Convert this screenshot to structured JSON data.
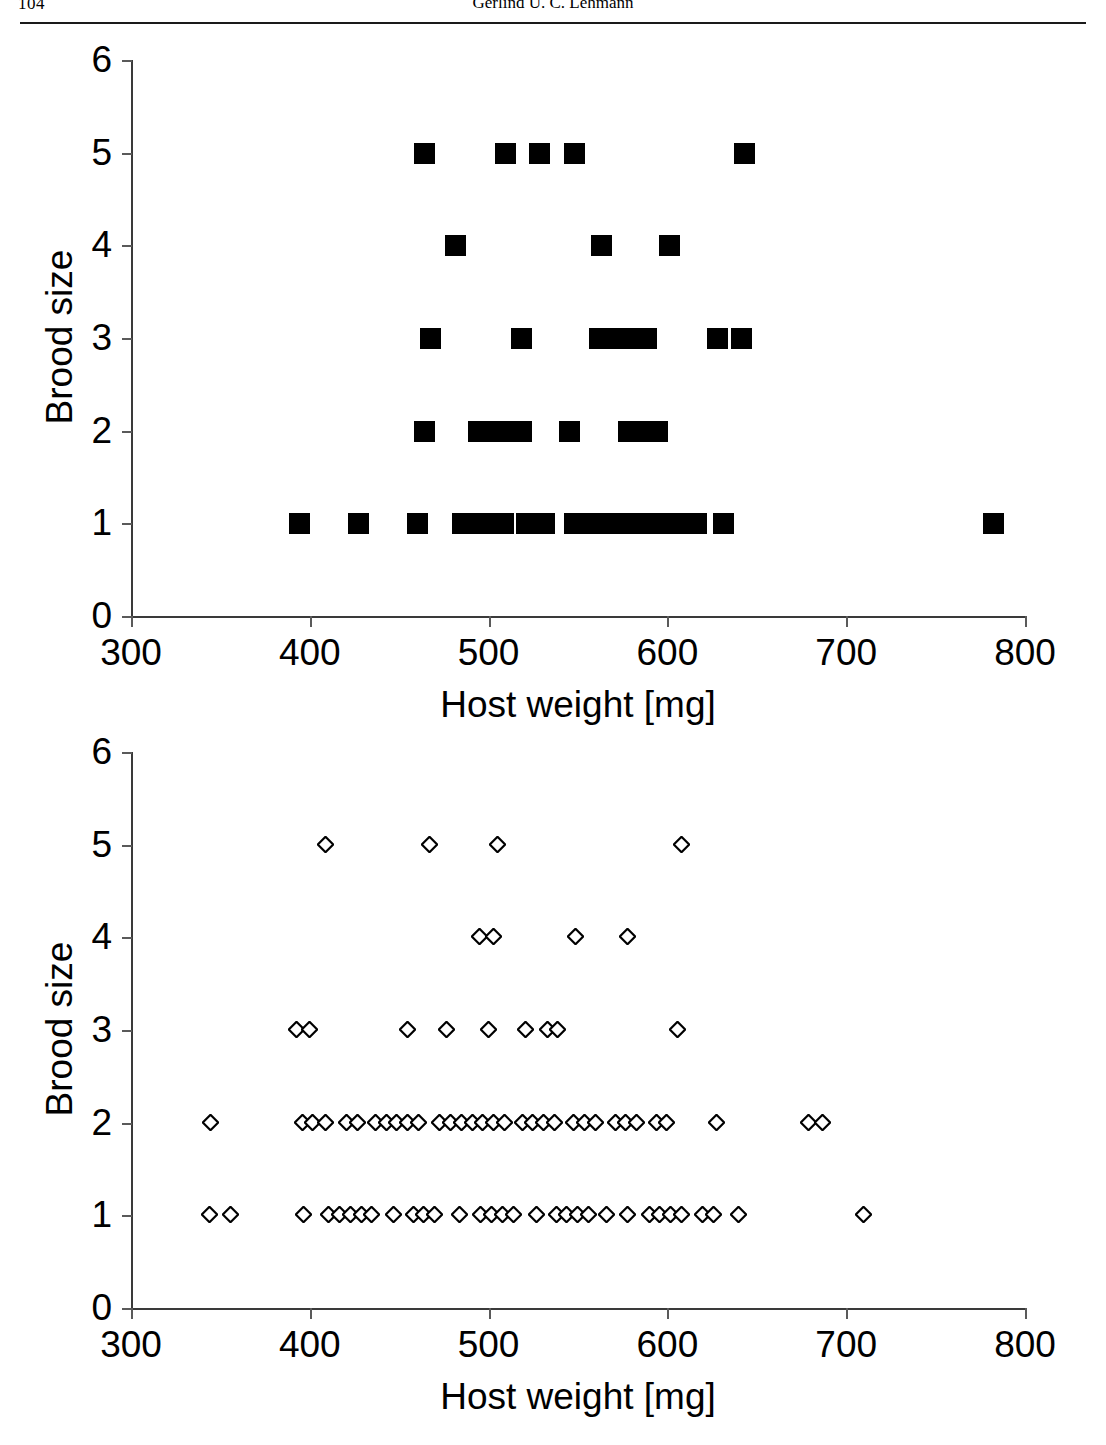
{
  "page": {
    "folio": "104",
    "running_head": "Gerlind U. C. Lehmann"
  },
  "charts": [
    {
      "id": "top",
      "marker_style": "filled-square"
    },
    {
      "id": "bottom",
      "marker_style": "open-diamond"
    }
  ],
  "chart_data": [
    {
      "type": "scatter",
      "title": "",
      "xlabel": "Host weight [mg]",
      "ylabel": "Brood size",
      "xlim": [
        300,
        800
      ],
      "ylim": [
        0,
        6
      ],
      "xticks": [
        300,
        400,
        500,
        600,
        700,
        800
      ],
      "yticks": [
        0,
        1,
        2,
        3,
        4,
        5,
        6
      ],
      "grid": false,
      "legend": false,
      "marker": "filled square",
      "series": [
        {
          "name": "Host weight vs brood size (filled squares)",
          "points": [
            [
              394,
              1
            ],
            [
              427,
              1
            ],
            [
              460,
              1
            ],
            [
              485,
              1
            ],
            [
              492,
              1
            ],
            [
              500,
              1
            ],
            [
              508,
              1
            ],
            [
              521,
              1
            ],
            [
              531,
              1
            ],
            [
              548,
              1
            ],
            [
              556,
              1
            ],
            [
              564,
              1
            ],
            [
              572,
              1
            ],
            [
              582,
              1
            ],
            [
              590,
              1
            ],
            [
              598,
              1
            ],
            [
              606,
              1
            ],
            [
              616,
              1
            ],
            [
              631,
              1
            ],
            [
              782,
              1
            ],
            [
              464,
              2
            ],
            [
              494,
              2
            ],
            [
              502,
              2
            ],
            [
              510,
              2
            ],
            [
              518,
              2
            ],
            [
              545,
              2
            ],
            [
              578,
              2
            ],
            [
              586,
              2
            ],
            [
              594,
              2
            ],
            [
              467,
              3
            ],
            [
              518,
              3
            ],
            [
              562,
              3
            ],
            [
              570,
              3
            ],
            [
              578,
              3
            ],
            [
              588,
              3
            ],
            [
              628,
              3
            ],
            [
              641,
              3
            ],
            [
              481,
              4
            ],
            [
              563,
              4
            ],
            [
              601,
              4
            ],
            [
              464,
              5
            ],
            [
              509,
              5
            ],
            [
              528,
              5
            ],
            [
              548,
              5
            ],
            [
              643,
              5
            ]
          ]
        }
      ]
    },
    {
      "type": "scatter",
      "title": "",
      "xlabel": "Host weight [mg]",
      "ylabel": "Brood size",
      "xlim": [
        300,
        800
      ],
      "ylim": [
        0,
        6
      ],
      "xticks": [
        300,
        400,
        500,
        600,
        700,
        800
      ],
      "yticks": [
        0,
        1,
        2,
        3,
        4,
        5,
        6
      ],
      "grid": false,
      "legend": false,
      "marker": "open diamond",
      "series": [
        {
          "name": "Host weight vs brood size (open diamonds)",
          "points": [
            [
              344,
              1
            ],
            [
              356,
              1
            ],
            [
              397,
              1
            ],
            [
              411,
              1
            ],
            [
              417,
              1
            ],
            [
              423,
              1
            ],
            [
              429,
              1
            ],
            [
              435,
              1
            ],
            [
              447,
              1
            ],
            [
              458,
              1
            ],
            [
              464,
              1
            ],
            [
              470,
              1
            ],
            [
              484,
              1
            ],
            [
              496,
              1
            ],
            [
              502,
              1
            ],
            [
              508,
              1
            ],
            [
              514,
              1
            ],
            [
              527,
              1
            ],
            [
              538,
              1
            ],
            [
              544,
              1
            ],
            [
              550,
              1
            ],
            [
              556,
              1
            ],
            [
              566,
              1
            ],
            [
              578,
              1
            ],
            [
              590,
              1
            ],
            [
              596,
              1
            ],
            [
              602,
              1
            ],
            [
              608,
              1
            ],
            [
              620,
              1
            ],
            [
              626,
              1
            ],
            [
              640,
              1
            ],
            [
              710,
              1
            ],
            [
              345,
              2
            ],
            [
              396,
              2
            ],
            [
              402,
              2
            ],
            [
              409,
              2
            ],
            [
              421,
              2
            ],
            [
              427,
              2
            ],
            [
              437,
              2
            ],
            [
              443,
              2
            ],
            [
              449,
              2
            ],
            [
              455,
              2
            ],
            [
              461,
              2
            ],
            [
              473,
              2
            ],
            [
              479,
              2
            ],
            [
              485,
              2
            ],
            [
              491,
              2
            ],
            [
              497,
              2
            ],
            [
              503,
              2
            ],
            [
              509,
              2
            ],
            [
              519,
              2
            ],
            [
              525,
              2
            ],
            [
              531,
              2
            ],
            [
              537,
              2
            ],
            [
              548,
              2
            ],
            [
              554,
              2
            ],
            [
              560,
              2
            ],
            [
              571,
              2
            ],
            [
              577,
              2
            ],
            [
              583,
              2
            ],
            [
              594,
              2
            ],
            [
              600,
              2
            ],
            [
              628,
              2
            ],
            [
              679,
              2
            ],
            [
              687,
              2
            ],
            [
              393,
              3
            ],
            [
              400,
              3
            ],
            [
              455,
              3
            ],
            [
              477,
              3
            ],
            [
              500,
              3
            ],
            [
              521,
              3
            ],
            [
              533,
              3
            ],
            [
              539,
              3
            ],
            [
              606,
              3
            ],
            [
              495,
              4
            ],
            [
              503,
              4
            ],
            [
              549,
              4
            ],
            [
              578,
              4
            ],
            [
              409,
              5
            ],
            [
              467,
              5
            ],
            [
              505,
              5
            ],
            [
              608,
              5
            ]
          ]
        }
      ]
    }
  ]
}
